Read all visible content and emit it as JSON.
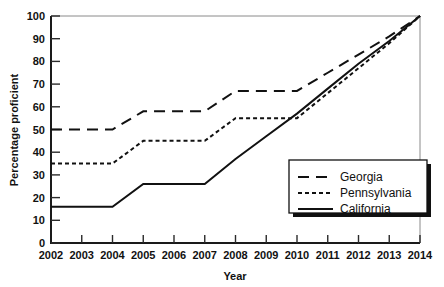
{
  "chart_data": {
    "type": "line",
    "title": "",
    "xlabel": "Year",
    "ylabel": "Percentage proficient",
    "x": [
      2002,
      2003,
      2004,
      2005,
      2006,
      2007,
      2008,
      2009,
      2010,
      2011,
      2012,
      2013,
      2014
    ],
    "xtick_labels": [
      "2002",
      "2003",
      "2004",
      "2005",
      "2006",
      "2007",
      "2008",
      "2009",
      "2010",
      "2011",
      "2012",
      "2013",
      "2014"
    ],
    "ytick_labels": [
      "0",
      "10",
      "20",
      "30",
      "40",
      "50",
      "60",
      "70",
      "80",
      "90",
      "100"
    ],
    "ytick_values": [
      0,
      10,
      20,
      30,
      40,
      50,
      60,
      70,
      80,
      90,
      100
    ],
    "xlim": [
      2002,
      2014
    ],
    "ylim": [
      0,
      100
    ],
    "grid": false,
    "legend_position": "bottom-right",
    "series": [
      {
        "name": "Georgia",
        "style": "long-dash",
        "dash_pattern": "11,7",
        "color": "#111111",
        "values": [
          50,
          50,
          50,
          58,
          58,
          58,
          67,
          67,
          67,
          75,
          83,
          91,
          100
        ]
      },
      {
        "name": "Pennsylvania",
        "style": "short-dash",
        "dash_pattern": "4,3",
        "color": "#111111",
        "values": [
          35,
          35,
          35,
          45,
          45,
          45,
          55,
          55,
          55,
          66,
          77,
          88,
          100
        ]
      },
      {
        "name": "California",
        "style": "solid",
        "dash_pattern": "none",
        "color": "#111111",
        "values": [
          16,
          16,
          16,
          26,
          26,
          26,
          37,
          47,
          57,
          68,
          79,
          89,
          100
        ]
      }
    ]
  },
  "legend": {
    "items": [
      {
        "label": "Georgia"
      },
      {
        "label": "Pennsylvania"
      },
      {
        "label": "California"
      }
    ]
  },
  "axes": {
    "x_title": "Year",
    "y_title": "Percentage proficient"
  }
}
